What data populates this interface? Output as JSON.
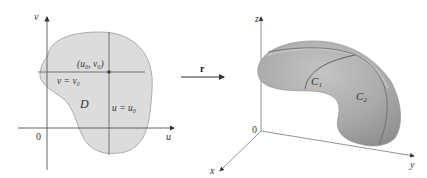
{
  "left_figure": {
    "axis_u_label": "u",
    "axis_v_label": "v",
    "origin_label": "0",
    "region_label": "D",
    "point_label": "(u₀, v₀)",
    "horizontal_line_label": "v = v₀",
    "vertical_line_label": "u = u₀",
    "region_fill": "#dcdcdc",
    "line_color": "#555555"
  },
  "mapping": {
    "arrow_label": "r"
  },
  "right_figure": {
    "axis_x_label": "x",
    "axis_y_label": "y",
    "axis_z_label": "z",
    "origin_label": "0",
    "curve_1_label": "C₁",
    "curve_2_label": "C₂",
    "surface_color": "#a8a8a8"
  }
}
